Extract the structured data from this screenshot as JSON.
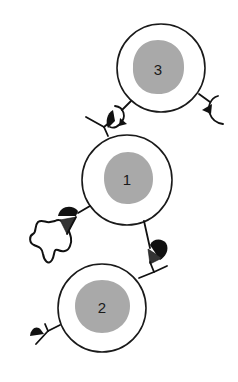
{
  "diagram": {
    "colors": {
      "background": "#ffffff",
      "outline": "#1a1a1a",
      "nucleus": "#a9a9a9",
      "ligand": "#111111"
    },
    "cells": [
      {
        "id": "cell-3",
        "label": "3"
      },
      {
        "id": "cell-1",
        "label": "1"
      },
      {
        "id": "cell-2",
        "label": "2"
      }
    ],
    "elements": [
      {
        "name": "receptor-ligand-between-cell-3-and-cell-1",
        "icon": "bound-receptor-icon"
      },
      {
        "name": "receptor-cell-3-right",
        "icon": "cup-receptor-icon"
      },
      {
        "name": "receptor-cell-1-left-bound-to-particle",
        "icon": "bound-receptor-icon"
      },
      {
        "name": "free-particle",
        "icon": "blob-icon"
      },
      {
        "name": "receptor-cell-1-lower-right",
        "icon": "bound-receptor-icon"
      },
      {
        "name": "receptor-cell-2-left",
        "icon": "triangle-ligand-icon"
      }
    ]
  }
}
